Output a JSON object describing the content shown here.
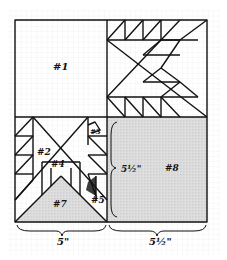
{
  "diagram": {
    "labels": {
      "p1": "#1",
      "p2": "#2",
      "p3": "#3",
      "p4": "#4",
      "p5": "#5",
      "p7": "#7",
      "p8": "#8"
    },
    "dimensions": {
      "bottom_left": "5\"",
      "bottom_right": "5½\"",
      "right_side": "5½\""
    },
    "colors": {
      "line": "#111111",
      "shade": "#d9d9d9",
      "grid": "#e6e6e6",
      "dark_patch": "#333333"
    }
  }
}
